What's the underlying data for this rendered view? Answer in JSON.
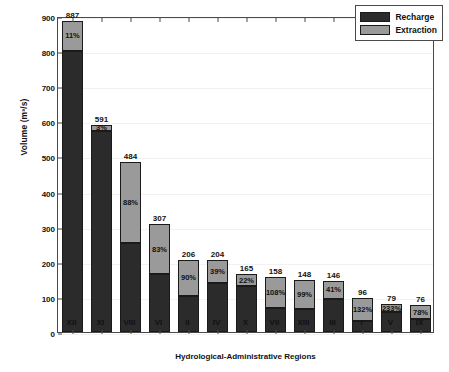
{
  "chart_data": {
    "type": "bar",
    "title": "",
    "subtitle": "",
    "xlabel": "Hydrological-Administrative Regions",
    "ylabel": "Volume (m³/s)",
    "ylim": [
      0,
      900
    ],
    "yticks": [
      0,
      100,
      200,
      300,
      400,
      500,
      600,
      700,
      800,
      900
    ],
    "grid": false,
    "stacked": true,
    "legend_position": "top-right",
    "legend": [
      "Recharge",
      "Extraction"
    ],
    "categories": [
      "XII",
      "XI",
      "VIII",
      "VI",
      "II",
      "IV",
      "X",
      "VII",
      "XIII",
      "III",
      "I",
      "V",
      "IX"
    ],
    "series": [
      {
        "name": "Recharge",
        "color": "#2b2b2b",
        "values": [
          800,
          572,
          253,
          164,
          104,
          141,
          131,
          68,
          66,
          95,
          32,
          56,
          38
        ]
      },
      {
        "name": "Extraction",
        "color": "#9a9a9a",
        "values": [
          87,
          19,
          231,
          143,
          102,
          63,
          34,
          90,
          82,
          51,
          64,
          23,
          38
        ]
      }
    ],
    "totals": [
      887,
      591,
      484,
      307,
      206,
      204,
      165,
      158,
      148,
      146,
      96,
      79,
      76
    ],
    "percent_labels": [
      "11%",
      "3%",
      "88%",
      "83%",
      "90%",
      "39%",
      "22%",
      "108%",
      "99%",
      "41%",
      "132%",
      "233%",
      "78%"
    ],
    "bars": [
      {
        "category": "XII",
        "total": 887,
        "recharge": 800,
        "extraction": 87,
        "percent": "11%"
      },
      {
        "category": "XI",
        "total": 591,
        "recharge": 572,
        "extraction": 19,
        "percent": "3%"
      },
      {
        "category": "VIII",
        "total": 484,
        "recharge": 253,
        "extraction": 231,
        "percent": "88%"
      },
      {
        "category": "VI",
        "total": 307,
        "recharge": 164,
        "extraction": 143,
        "percent": "83%"
      },
      {
        "category": "II",
        "total": 206,
        "recharge": 104,
        "extraction": 102,
        "percent": "90%"
      },
      {
        "category": "IV",
        "total": 204,
        "recharge": 141,
        "extraction": 63,
        "percent": "39%"
      },
      {
        "category": "X",
        "total": 165,
        "recharge": 131,
        "extraction": 34,
        "percent": "22%"
      },
      {
        "category": "VII",
        "total": 158,
        "recharge": 68,
        "extraction": 90,
        "percent": "108%"
      },
      {
        "category": "XIII",
        "total": 148,
        "recharge": 66,
        "extraction": 82,
        "percent": "99%"
      },
      {
        "category": "III",
        "total": 146,
        "recharge": 95,
        "extraction": 51,
        "percent": "41%"
      },
      {
        "category": "I",
        "total": 96,
        "recharge": 32,
        "extraction": 64,
        "percent": "132%"
      },
      {
        "category": "V",
        "total": 79,
        "recharge": 56,
        "extraction": 23,
        "percent": "233%"
      },
      {
        "category": "IX",
        "total": 76,
        "recharge": 38,
        "extraction": 38,
        "percent": "78%"
      }
    ]
  },
  "colors": {
    "recharge": "#2b2b2b",
    "extraction": "#9a9a9a",
    "axis": "#4a4a4a",
    "background": "#ffffff"
  }
}
